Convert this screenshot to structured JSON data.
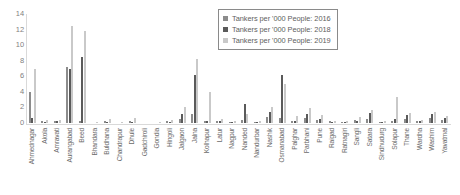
{
  "chart_data": {
    "type": "bar",
    "title": "",
    "xlabel": "",
    "ylabel": "",
    "ylim": [
      0,
      14
    ],
    "yticks": [
      0,
      2,
      4,
      6,
      8,
      10,
      12,
      14
    ],
    "grid": false,
    "legend_position": "top-right",
    "categories": [
      "Ahmednagar",
      "Akola",
      "Amravati",
      "Aurangabad",
      "Beed",
      "Bhandara",
      "Buldhana",
      "Chandrapur",
      "Dhule",
      "Gadchiroli",
      "Gondia",
      "Hingoli",
      "Jalgaon",
      "Jalna",
      "Kolhapur",
      "Latur",
      "Nagpur",
      "Nanded",
      "Nandurbar",
      "Nashik",
      "Osmanabad",
      "Palghar",
      "Parbhani",
      "Pune",
      "Raigad",
      "Ratnagiri",
      "Sangli",
      "Satara",
      "Sindhudurg",
      "Solapur",
      "Thane",
      "Wardha",
      "Washim",
      "Yavatmal"
    ],
    "series": [
      {
        "name": "Tankers per '000 People: 2016",
        "color": "#8c8c8c",
        "values": [
          4.0,
          0.2,
          0.3,
          7.2,
          0.3,
          0.0,
          0.2,
          0.0,
          0.2,
          0.0,
          0.0,
          0.2,
          0.5,
          1.2,
          0.2,
          0.3,
          0.1,
          0.4,
          0.1,
          0.8,
          0.6,
          0.3,
          0.7,
          0.4,
          0.2,
          0.1,
          0.4,
          0.5,
          0.1,
          0.3,
          0.5,
          0.2,
          0.6,
          0.4
        ]
      },
      {
        "name": "Tankers per '000 People: 2018",
        "color": "#5a5a5a",
        "values": [
          0.6,
          0.1,
          0.2,
          7.0,
          8.5,
          0.0,
          0.1,
          0.0,
          0.1,
          0.0,
          0.0,
          0.1,
          1.1,
          6.2,
          0.3,
          0.2,
          0.1,
          2.4,
          0.1,
          1.4,
          6.2,
          0.2,
          1.2,
          0.5,
          0.1,
          0.1,
          0.3,
          1.3,
          0.1,
          0.5,
          1.0,
          0.2,
          1.2,
          0.6
        ]
      },
      {
        "name": "Tankers per '000 People: 2019",
        "color": "#c9c9c9",
        "values": [
          7.0,
          0.4,
          0.4,
          12.4,
          11.8,
          0.1,
          0.5,
          0.1,
          0.6,
          0.0,
          0.1,
          0.4,
          2.0,
          8.2,
          4.0,
          0.5,
          0.2,
          1.1,
          0.2,
          2.1,
          5.0,
          0.9,
          1.9,
          1.0,
          0.3,
          0.2,
          0.8,
          1.7,
          0.2,
          3.3,
          1.3,
          0.4,
          1.4,
          0.9
        ]
      }
    ]
  },
  "legend": {
    "items": [
      "Tankers per '000 People: 2016",
      "Tankers per '000 People: 2018",
      "Tankers per '000 People: 2019"
    ]
  }
}
